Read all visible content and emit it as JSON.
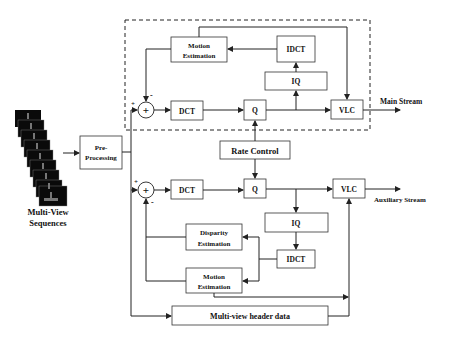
{
  "diagram": {
    "input": {
      "label_line1": "Multi-View",
      "label_line2": "Sequences",
      "frame_count": 9
    },
    "pre_processing": {
      "line1": "Pre-",
      "line2": "Processing"
    },
    "main_encoder": {
      "motion_estimation": {
        "line1": "Motion",
        "line2": "Estimation"
      },
      "idct": "IDCT",
      "iq": "IQ",
      "dct": "DCT",
      "q": "Q",
      "vlc": "VLC",
      "sum_symbol": "+",
      "plus_sign": "+",
      "minus_sign": "-",
      "output_label": "Main Stream"
    },
    "rate_control": "Rate Control",
    "aux_encoder": {
      "dct": "DCT",
      "q": "Q",
      "vlc": "VLC",
      "iq": "IQ",
      "idct": "IDCT",
      "disparity_estimation": {
        "line1": "Disparity",
        "line2": "Estimation"
      },
      "motion_estimation": {
        "line1": "Motion",
        "line2": "Estimation"
      },
      "sum_symbol": "+",
      "plus_sign": "+",
      "minus_sign": "-",
      "output_label": "Auxiliary Stream"
    },
    "header_data": "Multi-view header data"
  },
  "colors": {
    "line": "#222222",
    "background": "#ffffff",
    "frame": "#0a0a0a"
  }
}
